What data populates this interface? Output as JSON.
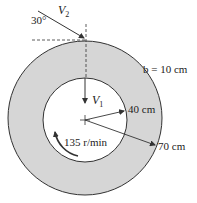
{
  "figure": {
    "type": "centrifugal-impeller-schematic",
    "colors": {
      "annulus_fill": "#d6d6d6",
      "inner_fill": "#ffffff",
      "stroke": "#333333"
    },
    "labels": {
      "angle": "30°",
      "v2": "V",
      "v2_sub": "2",
      "v1": "V",
      "v1_sub": "1",
      "width": "b = 10 cm",
      "inner_radius": "40 cm",
      "outer_radius": "70 cm",
      "rotation_speed": "135 r/min"
    }
  }
}
